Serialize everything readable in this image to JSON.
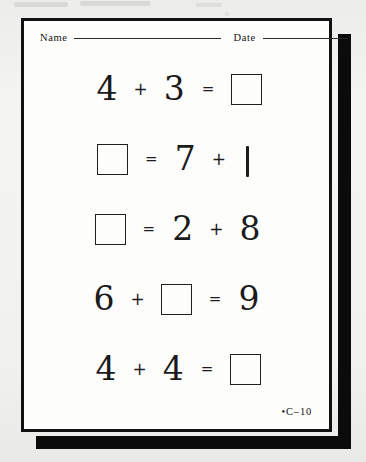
{
  "worksheet": {
    "header": {
      "name_label": "Name",
      "date_label": "Date",
      "name_value": "",
      "date_value": ""
    },
    "problems": [
      {
        "id": "problem-1",
        "tokens": [
          {
            "kind": "numeral",
            "text": "4"
          },
          {
            "kind": "operator",
            "text": "+"
          },
          {
            "kind": "numeral",
            "text": "3"
          },
          {
            "kind": "equals",
            "text": "="
          },
          {
            "kind": "answer-box",
            "text": ""
          }
        ]
      },
      {
        "id": "problem-2",
        "tokens": [
          {
            "kind": "answer-box",
            "text": ""
          },
          {
            "kind": "equals",
            "text": "="
          },
          {
            "kind": "numeral",
            "text": "7"
          },
          {
            "kind": "operator",
            "text": "+"
          },
          {
            "kind": "numeral-one",
            "text": "1"
          }
        ]
      },
      {
        "id": "problem-3",
        "tokens": [
          {
            "kind": "answer-box",
            "text": ""
          },
          {
            "kind": "equals",
            "text": "="
          },
          {
            "kind": "numeral",
            "text": "2"
          },
          {
            "kind": "operator",
            "text": "+"
          },
          {
            "kind": "numeral",
            "text": "8"
          }
        ]
      },
      {
        "id": "problem-4",
        "tokens": [
          {
            "kind": "numeral",
            "text": "6"
          },
          {
            "kind": "operator",
            "text": "+"
          },
          {
            "kind": "answer-box",
            "text": ""
          },
          {
            "kind": "equals",
            "text": "="
          },
          {
            "kind": "numeral",
            "text": "9"
          }
        ]
      },
      {
        "id": "problem-5",
        "tokens": [
          {
            "kind": "numeral",
            "text": "4"
          },
          {
            "kind": "operator",
            "text": "+"
          },
          {
            "kind": "numeral",
            "text": "4"
          },
          {
            "kind": "equals",
            "text": "="
          },
          {
            "kind": "answer-box",
            "text": ""
          }
        ]
      }
    ],
    "footer": {
      "page_code": "•C–10"
    },
    "colors": {
      "ink": "#1b1b1b",
      "border": "#111111",
      "shadow": "#0b0b0b",
      "paper": "#fdfdfc",
      "backdrop": "#f2f2f0"
    }
  }
}
